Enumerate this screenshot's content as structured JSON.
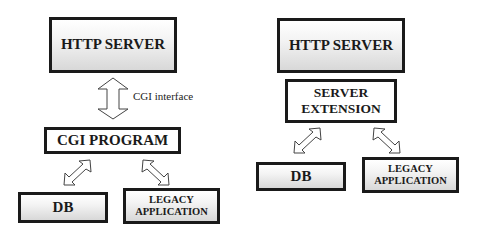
{
  "left_diagram": {
    "http_server": "HTTP SERVER",
    "interface_label": "CGI interface",
    "cgi_program": "CGI PROGRAM",
    "db": "DB",
    "legacy_line1": "LEGACY",
    "legacy_line2": "APPLICATION"
  },
  "right_diagram": {
    "http_server": "HTTP SERVER",
    "server_extension_line1": "SERVER",
    "server_extension_line2": "EXTENSION",
    "db": "DB",
    "legacy_line1": "LEGACY",
    "legacy_line2": "APPLICATION"
  },
  "colors": {
    "border": "#1a1a1a",
    "gradient_top": "#ffffff",
    "gradient_bottom": "#d8d8d8"
  }
}
